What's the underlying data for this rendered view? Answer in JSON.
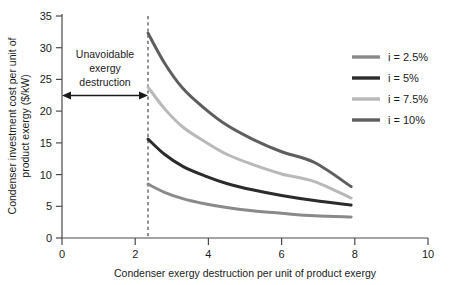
{
  "chart_data": {
    "type": "line",
    "title": "",
    "xlabel": "Condenser exergy destruction per unit of product exergy",
    "ylabel": "Condenser investment cost per unit of product exergy ($/kW)",
    "xlim": [
      0,
      10
    ],
    "ylim": [
      0,
      35
    ],
    "xticks": [
      0,
      2,
      4,
      6,
      8,
      10
    ],
    "yticks": [
      0,
      5,
      10,
      15,
      20,
      25,
      30,
      35
    ],
    "xtick_labels": [
      "0",
      "2",
      "4",
      "6",
      "8",
      "10"
    ],
    "ytick_labels": [
      "0",
      "5",
      "10",
      "15",
      "20",
      "25",
      "30",
      "35"
    ],
    "grid": false,
    "legend_position": "right",
    "series": [
      {
        "name": "i = 2.5%",
        "color": "#8a8a8a",
        "x": [
          2.35,
          2.8,
          3.3,
          3.9,
          4.5,
          5.2,
          6.0,
          6.9,
          7.9
        ],
        "y": [
          8.5,
          7.2,
          6.2,
          5.4,
          4.8,
          4.3,
          3.9,
          3.5,
          3.3
        ]
      },
      {
        "name": "i = 5%",
        "color": "#2b2b2b",
        "x": [
          2.35,
          2.8,
          3.3,
          3.9,
          4.5,
          5.2,
          6.0,
          6.9,
          7.9
        ],
        "y": [
          15.6,
          13.2,
          11.3,
          9.8,
          8.6,
          7.6,
          6.7,
          5.9,
          5.2
        ]
      },
      {
        "name": "i = 7.5%",
        "color": "#b9b9b9",
        "x": [
          2.35,
          2.8,
          3.3,
          3.9,
          4.5,
          5.2,
          6.0,
          6.9,
          7.9
        ],
        "y": [
          23.8,
          20.4,
          17.5,
          15.2,
          13.2,
          11.6,
          10.1,
          8.9,
          6.3
        ]
      },
      {
        "name": "i = 10%",
        "color": "#5e5e5e",
        "x": [
          2.35,
          2.8,
          3.3,
          3.9,
          4.5,
          5.2,
          6.0,
          6.9,
          7.9
        ],
        "y": [
          32.3,
          27.6,
          23.6,
          20.4,
          17.8,
          15.6,
          13.6,
          11.9,
          8.1
        ]
      }
    ],
    "annotations": [
      {
        "name": "unavoidable-region",
        "lines": [
          "Unavoidable",
          "exergy",
          "destruction"
        ],
        "arrow_from_x": 0,
        "arrow_to_x": 2.35,
        "arrow_y": 22.5,
        "divider_x": 2.35
      }
    ]
  },
  "legend": {
    "items": [
      {
        "label": "i = 2.5%",
        "color": "#8a8a8a"
      },
      {
        "label": "i = 5%",
        "color": "#2b2b2b"
      },
      {
        "label": "i = 7.5%",
        "color": "#b9b9b9"
      },
      {
        "label": "i = 10%",
        "color": "#5e5e5e"
      }
    ]
  },
  "annotation": {
    "line1": "Unavoidable",
    "line2": "exergy",
    "line3": "destruction"
  },
  "axes": {
    "x_title": "Condenser exergy destruction per unit of product exergy",
    "y_title_line1": "Condenser investment cost per unit of",
    "y_title_line2": "product exergy ($/kW)"
  }
}
